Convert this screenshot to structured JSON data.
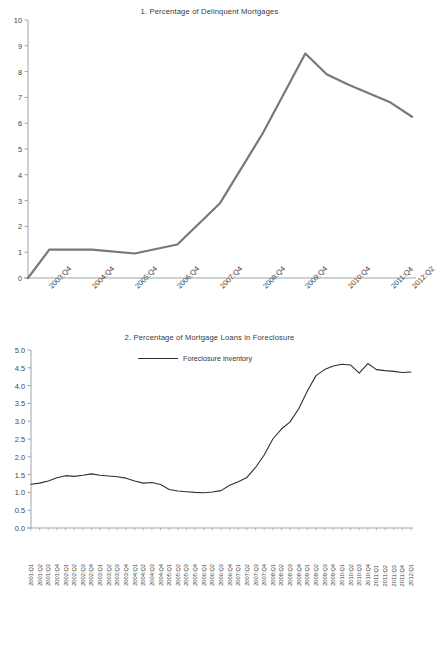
{
  "footer": {
    "text": ""
  },
  "chart_data": [
    {
      "type": "line",
      "title": "1. Percentage of Delinquent Mortgages",
      "xlabel": "",
      "ylabel": "",
      "ylim": [
        0,
        10
      ],
      "yticks": [
        0,
        1,
        2,
        3,
        4,
        5,
        6,
        7,
        8,
        9,
        10
      ],
      "ytick_labels": [
        "0",
        "1",
        "2",
        "3",
        "4",
        "5",
        "6",
        "7",
        "8",
        "9",
        "10"
      ],
      "grid": false,
      "legend": null,
      "line_color": "#787878",
      "line_width": 2.2,
      "xtick_labels": [
        "2003:Q4",
        "2004:Q4",
        "2005:Q4",
        "2006:Q4",
        "2007:Q4",
        "2008:Q4",
        "2009:Q4",
        "2010:Q4",
        "2011:Q4",
        "2012:Q2"
      ],
      "categories": [
        "2003:Q2",
        "2003:Q4",
        "2004:Q4",
        "2005:Q4",
        "2006:Q4",
        "2007:Q4",
        "2008:Q4",
        "2009:Q4",
        "2010:Q2",
        "2010:Q4",
        "2011:Q4",
        "2012:Q2"
      ],
      "values": [
        0.0,
        1.1,
        1.1,
        0.95,
        1.3,
        2.9,
        5.6,
        8.7,
        7.9,
        7.5,
        6.8,
        6.25
      ]
    },
    {
      "type": "line",
      "title": "2. Percentage of Mortgage Loans in Foreclosure",
      "xlabel": "",
      "ylabel": "",
      "ylim": [
        0.0,
        5.0
      ],
      "yticks": [
        0.0,
        0.5,
        1.0,
        1.5,
        2.0,
        2.5,
        3.0,
        3.5,
        4.0,
        4.5,
        5.0
      ],
      "ytick_labels": [
        "0.0",
        "0.5",
        "1.0",
        "1.5",
        "2.0",
        "2.5",
        "3.0",
        "3.5",
        "4.0",
        "4.5",
        "5.0"
      ],
      "grid": false,
      "legend": {
        "position": "top-center",
        "entries": [
          "Foreclosure inventory"
        ]
      },
      "line_color": "#2f2f2f",
      "line_width": 1.1,
      "series_name": "Foreclosure inventory",
      "categories": [
        "2001:Q1",
        "2001:Q2",
        "2001:Q3",
        "2001:Q4",
        "2002:Q1",
        "2002:Q2",
        "2002:Q3",
        "2002:Q4",
        "2003:Q1",
        "2003:Q2",
        "2003:Q3",
        "2003:Q4",
        "2004:Q1",
        "2004:Q2",
        "2004:Q3",
        "2004:Q4",
        "2005:Q1",
        "2005:Q2",
        "2005:Q3",
        "2005:Q4",
        "2006:Q1",
        "2006:Q2",
        "2006:Q3",
        "2006:Q4",
        "2007:Q1",
        "2007:Q2",
        "2007:Q3",
        "2007:Q4",
        "2008:Q1",
        "2008:Q2",
        "2008:Q3",
        "2008:Q4",
        "2009:Q1",
        "2009:Q2",
        "2009:Q3",
        "2009:Q4",
        "2010:Q1",
        "2010:Q2",
        "2010:Q3",
        "2010:Q4",
        "2011:Q1",
        "2011:Q2",
        "2011:Q3",
        "2011:Q4",
        "2012:Q1"
      ],
      "values": [
        1.23,
        1.26,
        1.32,
        1.41,
        1.47,
        1.45,
        1.48,
        1.52,
        1.48,
        1.46,
        1.44,
        1.4,
        1.32,
        1.26,
        1.28,
        1.22,
        1.08,
        1.04,
        1.02,
        1.0,
        0.99,
        1.01,
        1.05,
        1.2,
        1.3,
        1.42,
        1.7,
        2.05,
        2.5,
        2.78,
        2.98,
        3.35,
        3.85,
        4.28,
        4.45,
        4.55,
        4.6,
        4.58,
        4.35,
        4.62,
        4.45,
        4.42,
        4.4,
        4.37,
        4.38
      ]
    }
  ]
}
